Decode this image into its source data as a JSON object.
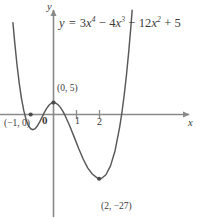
{
  "chart_data": {
    "type": "line",
    "title": "",
    "equation_text": "y = 3x4 − 4x3 − 12x2 + 5",
    "equation_parts": {
      "lhs": "y",
      "eq": "=",
      "t1_coef": "3",
      "t1_var": "x",
      "t1_exp": "4",
      "op1": "−",
      "t2_coef": "4",
      "t2_var": "x",
      "t2_exp": "3",
      "op2": "−",
      "t3_coef": "12",
      "t3_var": "x",
      "t3_exp": "2",
      "op3": "+",
      "t4_const": "5"
    },
    "function": "3*x^4 - 4*x^3 - 12*x^2 + 5",
    "xlabel": "x",
    "ylabel": "y",
    "xlim": [
      -1.78,
      6.1
    ],
    "ylim": [
      -33.5,
      39.0
    ],
    "grid": false,
    "legend": null,
    "x_ticks": [
      {
        "value": 1,
        "label": "1"
      },
      {
        "value": 2,
        "label": "2"
      }
    ],
    "y_ticks": [],
    "origin_label": "0",
    "annotations": [
      {
        "name": "x-intercept-left",
        "label": "(−1, 0)",
        "x": -1,
        "y": 0,
        "marker": true
      },
      {
        "name": "local-maximum",
        "label": "(0, 5)",
        "x": 0,
        "y": 5,
        "marker": true
      },
      {
        "name": "global-minimum",
        "label": "(2, −27)",
        "x": 2,
        "y": -27,
        "marker": true
      }
    ],
    "series": [
      {
        "name": "quartic-curve",
        "color": "#585858",
        "values": [
          {
            "x": -1.78,
            "y": 38.6
          },
          {
            "x": -1.7,
            "y": 30.2
          },
          {
            "x": -1.6,
            "y": 20.8
          },
          {
            "x": -1.5,
            "y": 12.9
          },
          {
            "x": -1.4,
            "y": 6.5
          },
          {
            "x": -1.3,
            "y": 1.5
          },
          {
            "x": -1.2,
            "y": -2.2
          },
          {
            "x": -1.1,
            "y": -4.7
          },
          {
            "x": -1.0,
            "y": -6.0
          },
          {
            "x": -0.9,
            "y": -6.4
          },
          {
            "x": -0.8,
            "y": -5.9
          },
          {
            "x": -0.7,
            "y": -4.7
          },
          {
            "x": -0.6,
            "y": -3.0
          },
          {
            "x": -0.5,
            "y": -1.1
          },
          {
            "x": -0.4,
            "y": 0.9
          },
          {
            "x": -0.3,
            "y": 2.6
          },
          {
            "x": -0.2,
            "y": 3.9
          },
          {
            "x": -0.1,
            "y": 4.7
          },
          {
            "x": 0.0,
            "y": 5.0
          },
          {
            "x": 0.1,
            "y": 4.8
          },
          {
            "x": 0.2,
            "y": 4.1
          },
          {
            "x": 0.3,
            "y": 3.0
          },
          {
            "x": 0.4,
            "y": 1.5
          },
          {
            "x": 0.5,
            "y": -0.3
          },
          {
            "x": 0.7,
            "y": -4.5
          },
          {
            "x": 0.9,
            "y": -9.3
          },
          {
            "x": 1.1,
            "y": -14.2
          },
          {
            "x": 1.3,
            "y": -18.7
          },
          {
            "x": 1.5,
            "y": -22.4
          },
          {
            "x": 1.7,
            "y": -25.0
          },
          {
            "x": 1.9,
            "y": -26.5
          },
          {
            "x": 2.0,
            "y": -27.0
          },
          {
            "x": 2.1,
            "y": -26.9
          },
          {
            "x": 2.3,
            "y": -25.3
          },
          {
            "x": 2.5,
            "y": -21.6
          },
          {
            "x": 2.7,
            "y": -15.2
          },
          {
            "x": 2.9,
            "y": -5.4
          },
          {
            "x": 3.0,
            "y": 0.8
          },
          {
            "x": 3.1,
            "y": 8.1
          },
          {
            "x": 3.2,
            "y": 16.6
          },
          {
            "x": 3.3,
            "y": 26.4
          },
          {
            "x": 3.4,
            "y": 37.6
          },
          {
            "x": 3.45,
            "y": 43.8
          }
        ]
      }
    ]
  },
  "axes": {
    "x_axis_name": "x-axis",
    "y_axis_name": "y-axis",
    "axis_color": "#8a8a8a"
  }
}
